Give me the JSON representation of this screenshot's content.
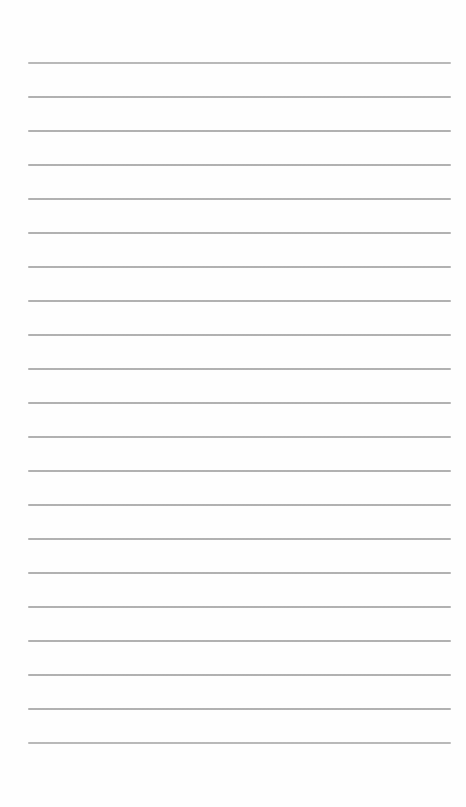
{
  "paper": {
    "description": "blank-lined-notebook-page",
    "width_px": 466,
    "height_px": 807,
    "background_color": "#fefefe",
    "line_color": "#8b8b8b",
    "line_count": 21,
    "first_line_top_px": 62,
    "line_spacing_px": 34,
    "line_left_px": 28,
    "line_width_px": 423,
    "line_thickness_px": 2
  }
}
